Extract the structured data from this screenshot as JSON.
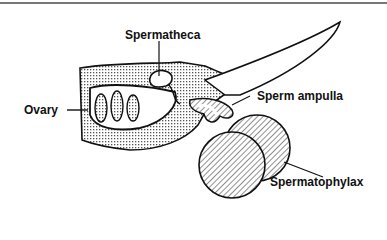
{
  "title": "",
  "labels": {
    "spermatheca": "Spermatheca",
    "ovary": "Ovary",
    "sperm_ampulla": "Sperm ampulla",
    "spermatophylax": "Spermatophylax"
  },
  "colors": {
    "ink": "#111111",
    "rule": "#777777"
  }
}
